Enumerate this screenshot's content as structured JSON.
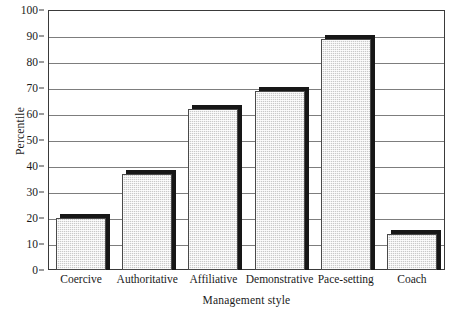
{
  "chart_data": {
    "type": "bar",
    "title": "",
    "xlabel": "Management style",
    "ylabel": "Percentile",
    "categories": [
      "Coercive",
      "Authoritative",
      "Affiliative",
      "Demonstrative",
      "Pace-setting",
      "Coach"
    ],
    "values": [
      20,
      37,
      62,
      69,
      89,
      14
    ],
    "ylim": [
      0,
      100
    ],
    "yticks": [
      0,
      10,
      20,
      30,
      40,
      50,
      60,
      70,
      80,
      90,
      100
    ],
    "ytick_labels": [
      "0",
      "10",
      "20",
      "30",
      "40",
      "50",
      "60",
      "70",
      "80",
      "90",
      "100"
    ],
    "grid": true,
    "legend": null,
    "bar_style": {
      "fill": "#c9c9c9",
      "pattern": "checkered-dither",
      "edge": "#4a4a4a",
      "shadow": "#171717",
      "shadow_offset_px": 4
    },
    "frame_color": "#3a3a3a",
    "gridline_color": "#7d7d7d",
    "background": "#ffffff"
  }
}
